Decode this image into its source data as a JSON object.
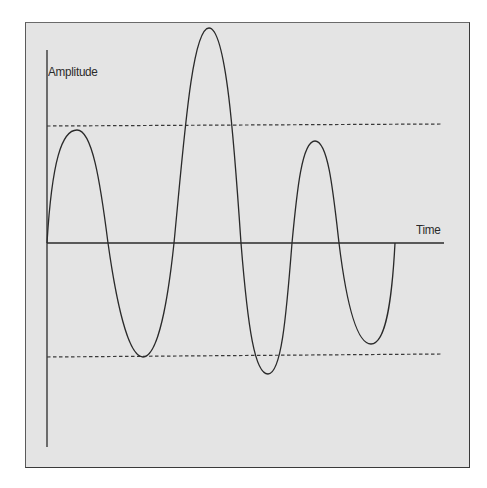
{
  "diagram": {
    "title": "",
    "y_axis_label": "Amplitude",
    "x_axis_label": "Time",
    "colors": {
      "background": "#e4e4e4",
      "frame": "#3a3a3a",
      "ink": "#2a2a2a"
    },
    "reference_lines": [
      {
        "name": "upper-threshold",
        "style": "dashed"
      },
      {
        "name": "lower-threshold",
        "style": "dashed"
      }
    ],
    "wave": {
      "description": "oscillating waveform with varying amplitude",
      "extrema": [
        {
          "type": "peak",
          "relative_height": "at upper threshold"
        },
        {
          "type": "trough",
          "relative_height": "at lower threshold"
        },
        {
          "type": "peak",
          "relative_height": "exceeds upper threshold"
        },
        {
          "type": "trough",
          "relative_height": "exceeds lower threshold"
        },
        {
          "type": "peak",
          "relative_height": "below upper threshold"
        },
        {
          "type": "trough",
          "relative_height": "above lower threshold"
        }
      ]
    }
  }
}
